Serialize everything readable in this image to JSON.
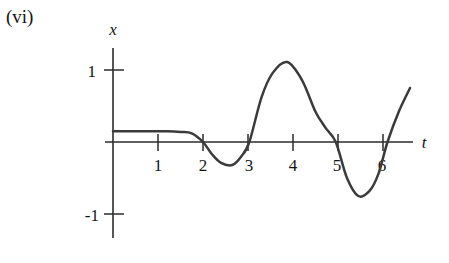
{
  "figure": {
    "part_label": "(vi)",
    "axis_x_name": "t",
    "axis_y_name": "x",
    "line_color": "#3b3b3b",
    "axis_color": "#2b2b2b",
    "text_color": "#141414"
  },
  "chart_data": {
    "type": "line",
    "title": "(vi)",
    "xlabel": "t",
    "ylabel": "x",
    "xlim": [
      -0.2,
      6.9
    ],
    "ylim": [
      -1.35,
      1.35
    ],
    "grid": false,
    "legend": "none",
    "x_ticks": [
      1,
      2,
      3,
      4,
      5,
      6
    ],
    "x_tick_labels": [
      "1",
      "2",
      "3",
      "4",
      "5",
      "6"
    ],
    "y_ticks": [
      1,
      -1
    ],
    "y_tick_labels": [
      "1",
      "-1"
    ],
    "series": [
      {
        "name": "x(t)",
        "x": [
          0.0,
          0.3,
          0.6,
          0.9,
          1.2,
          1.5,
          1.75,
          2.0,
          2.2,
          2.4,
          2.65,
          2.85,
          3.03,
          3.3,
          3.55,
          3.87,
          4.2,
          4.5,
          4.72,
          4.95,
          5.2,
          5.45,
          5.7,
          5.9,
          6.1,
          6.35,
          6.6
        ],
        "y": [
          0.15,
          0.15,
          0.15,
          0.15,
          0.15,
          0.14,
          0.12,
          0.0,
          -0.17,
          -0.29,
          -0.32,
          -0.2,
          0.0,
          0.62,
          0.96,
          1.11,
          0.86,
          0.42,
          0.2,
          0.0,
          -0.5,
          -0.75,
          -0.68,
          -0.44,
          0.0,
          0.42,
          0.75
        ]
      }
    ],
    "annotations": [
      {
        "text": "flat segment near x = 0.15 for t < 1.8"
      },
      {
        "text": "minimum -0.32 near t = 2.65"
      },
      {
        "text": "maximum 1.11 near t = 3.87"
      },
      {
        "text": "minimum -0.75 near t = 5.45"
      }
    ]
  }
}
